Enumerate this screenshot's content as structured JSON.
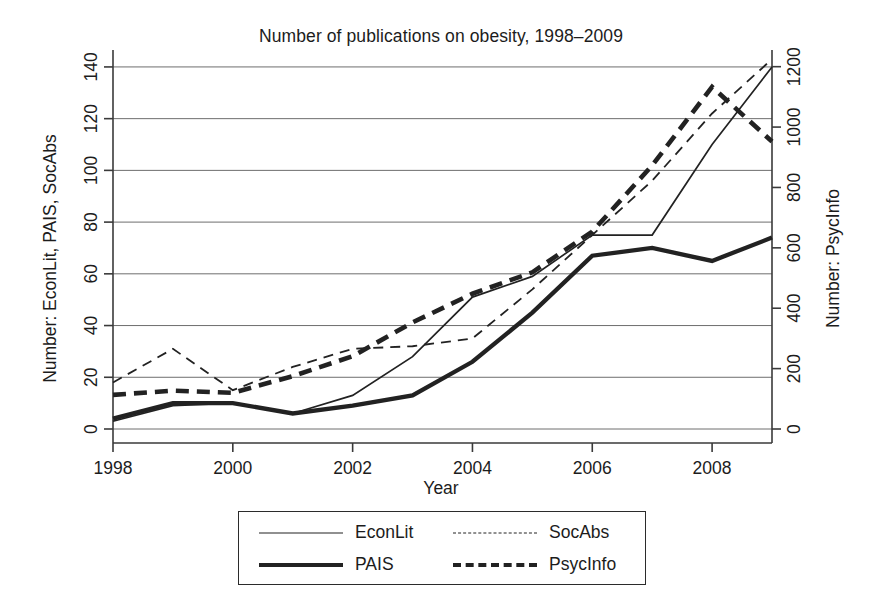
{
  "chart_data": {
    "type": "line",
    "title": "Number of publications on obesity, 1998–2009",
    "xlabel": "Year",
    "ylabel": "Number: EconLit, PAIS, SocAbs",
    "ylabel_right": "Number: PsycInfo",
    "x": [
      1998,
      1999,
      2000,
      2001,
      2002,
      2003,
      2004,
      2005,
      2006,
      2007,
      2008,
      2009
    ],
    "xlim": [
      1998,
      2009
    ],
    "xticks": [
      "1998",
      "2000",
      "2002",
      "2004",
      "2006",
      "2008"
    ],
    "xtick_values": [
      1998,
      2000,
      2002,
      2004,
      2006,
      2008
    ],
    "ylim": [
      0,
      145
    ],
    "yticks": [
      "0",
      "20",
      "40",
      "60",
      "80",
      "100",
      "120",
      "140"
    ],
    "ytick_values": [
      0,
      20,
      40,
      60,
      80,
      100,
      120,
      140
    ],
    "ylim_right": [
      0,
      1242
    ],
    "yticks_right": [
      "0",
      "200",
      "400",
      "600",
      "800",
      "1000",
      "1200"
    ],
    "ytick_values_right": [
      0,
      200,
      400,
      600,
      800,
      1000,
      1200
    ],
    "grid": true,
    "legend_position": "below-center",
    "series": [
      {
        "name": "EconLit",
        "axis": "left",
        "style": "solid-thin",
        "values": [
          3,
          9,
          10,
          6,
          13,
          28,
          51,
          59,
          75,
          75,
          110,
          140
        ]
      },
      {
        "name": "PAIS",
        "axis": "left",
        "style": "solid-thick",
        "values": [
          4,
          10,
          10,
          6,
          9,
          13,
          26,
          45,
          67,
          70,
          65,
          74
        ]
      },
      {
        "name": "SocAbs",
        "axis": "left",
        "style": "dashed-thin",
        "values": [
          18,
          31,
          15,
          24,
          31,
          32,
          35,
          54,
          75,
          96,
          122,
          143
        ]
      },
      {
        "name": "PsycInfo",
        "axis": "right",
        "style": "dashed-thick",
        "values": [
          113,
          127,
          120,
          175,
          241,
          353,
          448,
          519,
          654,
          873,
          1133,
          952
        ]
      }
    ]
  },
  "legend": {
    "items": [
      {
        "label": "EconLit",
        "style": "solid-thin"
      },
      {
        "label": "SocAbs",
        "style": "dashed-thin"
      },
      {
        "label": "PAIS",
        "style": "solid-thick"
      },
      {
        "label": "PsycInfo",
        "style": "dashed-thick"
      }
    ]
  }
}
